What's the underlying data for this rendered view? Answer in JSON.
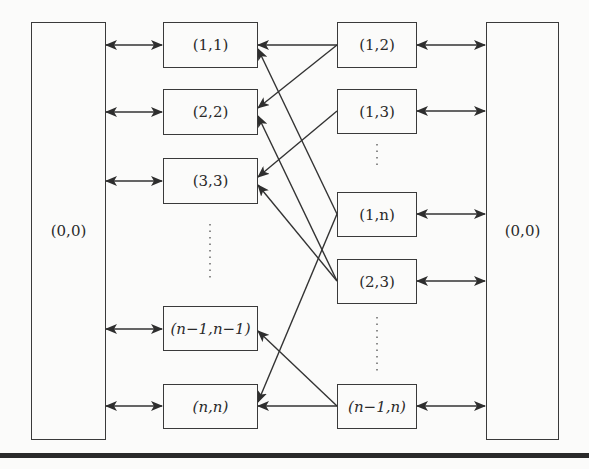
{
  "diagram": {
    "left_hub": {
      "label": "(0,0)"
    },
    "right_hub": {
      "label": "(0,0)"
    },
    "left_nodes": [
      {
        "id": "n11",
        "label": "(1,1)"
      },
      {
        "id": "n22",
        "label": "(2,2)"
      },
      {
        "id": "n33",
        "label": "(3,3)"
      },
      {
        "id": "nm1m1",
        "label": "(n−1,n−1)"
      },
      {
        "id": "nnn",
        "label": "(n,n)"
      }
    ],
    "right_nodes": [
      {
        "id": "n12",
        "label": "(1,2)"
      },
      {
        "id": "n13",
        "label": "(1,3)"
      },
      {
        "id": "n1n",
        "label": "(1,n)"
      },
      {
        "id": "n23",
        "label": "(2,3)"
      },
      {
        "id": "nm1n",
        "label": "(n−1,n)"
      }
    ],
    "ellipsis": "⋮",
    "edges": [
      {
        "from": "(1,2)",
        "to": "(1,1)"
      },
      {
        "from": "(1,2)",
        "to": "(2,2)"
      },
      {
        "from": "(1,3)",
        "to": "(3,3)"
      },
      {
        "from": "(1,n)",
        "to": "(1,1)"
      },
      {
        "from": "(1,n)",
        "to": "(n,n)"
      },
      {
        "from": "(2,3)",
        "to": "(2,2)"
      },
      {
        "from": "(2,3)",
        "to": "(3,3)"
      },
      {
        "from": "(n−1,n)",
        "to": "(n−1,n−1)"
      },
      {
        "from": "(n−1,n)",
        "to": "(n,n)"
      }
    ],
    "bidirectional_links": [
      "(0,0) ↔ (1,1)",
      "(0,0) ↔ (2,2)",
      "(0,0) ↔ (3,3)",
      "(0,0) ↔ (n−1,n−1)",
      "(0,0) ↔ (n,n)",
      "(1,2) ↔ (0,0)",
      "(1,3) ↔ (0,0)",
      "(1,n) ↔ (0,0)",
      "(2,3) ↔ (0,0)",
      "(n−1,n) ↔ (0,0)"
    ]
  }
}
